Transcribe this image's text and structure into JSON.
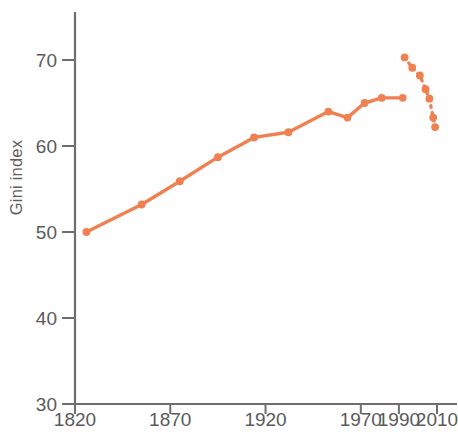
{
  "chart_data": {
    "type": "line",
    "title": "",
    "subtitle": "",
    "xlabel": "",
    "ylabel": "Gini index",
    "xlim": [
      1820,
      2013
    ],
    "ylim": [
      30,
      75
    ],
    "grid": false,
    "legend": "none",
    "accent_color": "#ef8052",
    "axis_color": "#6e6e6e",
    "x_ticks": [
      1820,
      1870,
      1920,
      1970,
      1990,
      2010
    ],
    "x_tick_labels": [
      "1820",
      "1870",
      "1920",
      "1970",
      "1990",
      "2010"
    ],
    "y_ticks": [
      30,
      40,
      50,
      60,
      70
    ],
    "y_tick_labels": [
      "30",
      "40",
      "50",
      "60",
      "70"
    ],
    "series": [
      {
        "name": "Global Gini index (historical estimates)",
        "style": "solid",
        "x": [
          1826,
          1855,
          1875,
          1895,
          1914,
          1932,
          1953,
          1963,
          1972,
          1981,
          1992
        ],
        "values": [
          50.0,
          53.2,
          55.9,
          58.7,
          61.0,
          61.6,
          64.0,
          63.3,
          65.0,
          65.6,
          65.6
        ]
      },
      {
        "name": "Global Gini index (recent estimates)",
        "style": "dotted",
        "x": [
          1993,
          1997,
          2001,
          2004,
          2006,
          2008,
          2009
        ],
        "values": [
          70.3,
          69.1,
          68.2,
          66.6,
          65.5,
          63.3,
          62.2
        ]
      }
    ]
  }
}
